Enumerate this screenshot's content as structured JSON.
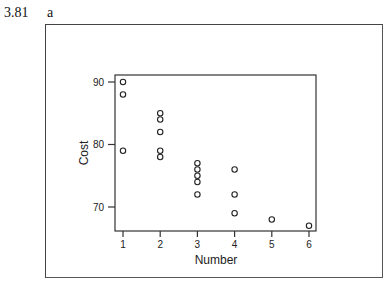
{
  "figure": {
    "number": "3.81",
    "panel": "a"
  },
  "chart_data": {
    "type": "scatter",
    "title": "",
    "xlabel": "Number",
    "ylabel": "Cost",
    "xlim": [
      0.8,
      6.2
    ],
    "ylim": [
      66,
      91
    ],
    "x_ticks": [
      1,
      2,
      3,
      4,
      5,
      6
    ],
    "y_ticks": [
      70,
      80,
      90
    ],
    "grid": false,
    "legend": null,
    "marker": "open-circle",
    "points": [
      {
        "x": 1,
        "y": 90
      },
      {
        "x": 1,
        "y": 88
      },
      {
        "x": 1,
        "y": 79
      },
      {
        "x": 2,
        "y": 85
      },
      {
        "x": 2,
        "y": 84
      },
      {
        "x": 2,
        "y": 82
      },
      {
        "x": 2,
        "y": 79
      },
      {
        "x": 2,
        "y": 78
      },
      {
        "x": 3,
        "y": 77
      },
      {
        "x": 3,
        "y": 76
      },
      {
        "x": 3,
        "y": 75
      },
      {
        "x": 3,
        "y": 74
      },
      {
        "x": 3,
        "y": 72
      },
      {
        "x": 4,
        "y": 76
      },
      {
        "x": 4,
        "y": 72
      },
      {
        "x": 4,
        "y": 69
      },
      {
        "x": 5,
        "y": 68
      },
      {
        "x": 6,
        "y": 67
      }
    ]
  }
}
